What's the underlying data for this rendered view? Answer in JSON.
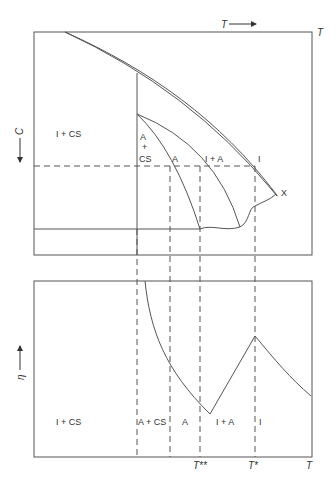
{
  "figure": {
    "top_panel": {
      "x_axis_label": "T",
      "x_axis_arrow_label": "T",
      "y_axis_label": "C",
      "regions": [
        {
          "label": "I + CS"
        },
        {
          "label_line1": "A",
          "label_line2": "+",
          "label_line3": "CS"
        },
        {
          "label": "A"
        },
        {
          "label": "I + A"
        },
        {
          "label": "I"
        }
      ],
      "point_label": "X"
    },
    "bottom_panel": {
      "y_axis_label": "η",
      "regions": [
        "I + CS",
        "A + CS",
        "A",
        "I + A",
        "I"
      ],
      "x_ticks": [
        "T**",
        "T*",
        "T"
      ]
    }
  }
}
